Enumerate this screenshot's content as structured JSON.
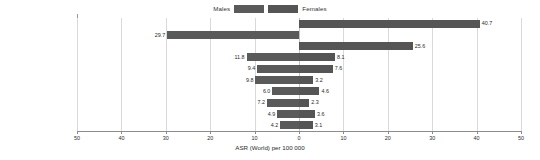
{
  "legend": {
    "male_label": "Males",
    "female_label": "Females",
    "male_color": "#5a5a5a",
    "female_color": "#555555"
  },
  "axis": {
    "title": "ASR (World) per 100 000",
    "ticks": [
      "50",
      "40",
      "30",
      "20",
      "10",
      "0",
      "10",
      "20",
      "30",
      "40",
      "50"
    ]
  },
  "chart_data": {
    "type": "bar",
    "orientation": "horizontal-diverging",
    "title": "",
    "xlabel": "ASR (World) per 100 000",
    "ylabel": "",
    "xlim": [
      -50,
      50
    ],
    "grid": true,
    "legend_position": "top-center",
    "categories": [
      "Breast",
      "Prostate",
      "Cervix uteri",
      "Liver",
      "Colorectum",
      "Lung",
      "Non-Hodgkin lymphoma",
      "Bladder",
      "Stomach",
      "Oesophagus"
    ],
    "series": [
      {
        "name": "Males",
        "side": "left",
        "color": "#5a5a5a",
        "values": [
          0,
          29.7,
          0,
          11.8,
          9.4,
          9.8,
          6.0,
          7.2,
          4.9,
          4.2
        ]
      },
      {
        "name": "Females",
        "side": "right",
        "color": "#555555",
        "values": [
          40.7,
          0,
          25.6,
          8.1,
          7.6,
          3.2,
          4.6,
          2.3,
          3.6,
          3.1
        ]
      }
    ],
    "rows": [
      {
        "category": "Breast",
        "male": 0,
        "female": 40.7,
        "male_label": "",
        "female_label": "40.7"
      },
      {
        "category": "Prostate",
        "male": 29.7,
        "female": 0,
        "male_label": "29.7",
        "female_label": ""
      },
      {
        "category": "Cervix uteri",
        "male": 0,
        "female": 25.6,
        "male_label": "",
        "female_label": "25.6"
      },
      {
        "category": "Liver",
        "male": 11.8,
        "female": 8.1,
        "male_label": "11.8",
        "female_label": "8.1"
      },
      {
        "category": "Colorectum",
        "male": 9.4,
        "female": 7.6,
        "male_label": "9.4",
        "female_label": "7.6"
      },
      {
        "category": "Lung",
        "male": 9.8,
        "female": 3.2,
        "male_label": "9.8",
        "female_label": "3.2"
      },
      {
        "category": "Non-Hodgkin lymphoma",
        "male": 6.0,
        "female": 4.6,
        "male_label": "6.0",
        "female_label": "4.6"
      },
      {
        "category": "Bladder",
        "male": 7.2,
        "female": 2.3,
        "male_label": "7.2",
        "female_label": "2.3"
      },
      {
        "category": "Stomach",
        "male": 4.9,
        "female": 3.6,
        "male_label": "4.9",
        "female_label": "3.6"
      },
      {
        "category": "Oesophagus",
        "male": 4.2,
        "female": 3.1,
        "male_label": "4.2",
        "female_label": "3.1"
      }
    ]
  }
}
